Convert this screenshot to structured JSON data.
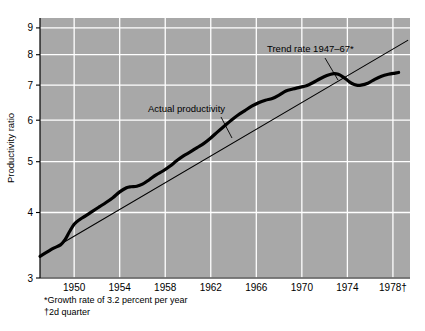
{
  "chart_data": {
    "type": "line",
    "title": "",
    "xlabel": "",
    "ylabel": "Productivity ratio",
    "yscale": "log",
    "ylim": [
      3,
      9.4
    ],
    "xlim": [
      1947,
      1979.5
    ],
    "yticks": [
      3,
      4,
      5,
      6,
      7,
      8,
      9
    ],
    "ytick_labels": [
      "3",
      "4",
      "5",
      "6",
      "7",
      "8",
      "9"
    ],
    "xticks": [
      1950,
      1954,
      1958,
      1962,
      1966,
      1970,
      1974,
      1978
    ],
    "xtick_labels": [
      "1950",
      "1954",
      "1958",
      "1962",
      "1966",
      "1970",
      "1974",
      "1978†"
    ],
    "grid": "both",
    "legend": "none",
    "background": "#a8a8a8",
    "gridline_color": "#ffffff",
    "series": [
      {
        "name": "Actual productivity",
        "style": "thick-solid",
        "color": "#000000",
        "width": 3.2,
        "x": [
          1947.0,
          1947.6,
          1948.2,
          1948.8,
          1949.2,
          1949.6,
          1950.0,
          1950.5,
          1951.0,
          1951.6,
          1952.2,
          1952.8,
          1953.4,
          1954.0,
          1954.6,
          1955.0,
          1955.5,
          1956.0,
          1956.6,
          1957.2,
          1957.8,
          1958.4,
          1959.0,
          1959.6,
          1960.2,
          1960.8,
          1961.4,
          1962.0,
          1962.6,
          1963.2,
          1963.8,
          1964.4,
          1965.0,
          1965.6,
          1966.2,
          1966.8,
          1967.4,
          1968.0,
          1968.6,
          1969.2,
          1969.8,
          1970.4,
          1971.0,
          1971.6,
          1972.2,
          1972.8,
          1973.2,
          1973.6,
          1974.0,
          1974.4,
          1974.8,
          1975.2,
          1975.8,
          1976.4,
          1977.0,
          1977.6,
          1978.2,
          1978.5
        ],
        "y": [
          3.3,
          3.36,
          3.42,
          3.47,
          3.55,
          3.68,
          3.8,
          3.88,
          3.94,
          4.02,
          4.1,
          4.18,
          4.27,
          4.38,
          4.46,
          4.48,
          4.49,
          4.53,
          4.62,
          4.72,
          4.8,
          4.9,
          5.02,
          5.13,
          5.22,
          5.32,
          5.42,
          5.55,
          5.7,
          5.85,
          6.0,
          6.14,
          6.26,
          6.38,
          6.48,
          6.55,
          6.6,
          6.7,
          6.82,
          6.88,
          6.93,
          6.98,
          7.08,
          7.2,
          7.3,
          7.36,
          7.34,
          7.26,
          7.15,
          7.05,
          7.0,
          7.0,
          7.06,
          7.18,
          7.28,
          7.34,
          7.38,
          7.4
        ]
      },
      {
        "name": "Trend rate 1947–67*",
        "style": "thin-solid",
        "color": "#000000",
        "width": 1.1,
        "growth_rate_percent_per_year": 3.2,
        "x": [
          1947.0,
          1979.3
        ],
        "y": [
          3.3,
          8.52
        ]
      }
    ],
    "annotations": [
      {
        "name": "trend-rate-label",
        "text": "Trend rate 1947–67*",
        "x": 267,
        "y": 52,
        "anchor": "start",
        "leader": {
          "x1": 325,
          "y1": 58,
          "x2": 338,
          "y2": 80
        }
      },
      {
        "name": "actual-productivity-label",
        "text": "Actual productivity",
        "x": 148,
        "y": 112,
        "anchor": "start",
        "leader": {
          "x1": 221,
          "y1": 117,
          "x2": 232,
          "y2": 138
        }
      }
    ],
    "footnotes": [
      "*Growth rate of 3.2 percent per year",
      "†2d quarter"
    ]
  }
}
